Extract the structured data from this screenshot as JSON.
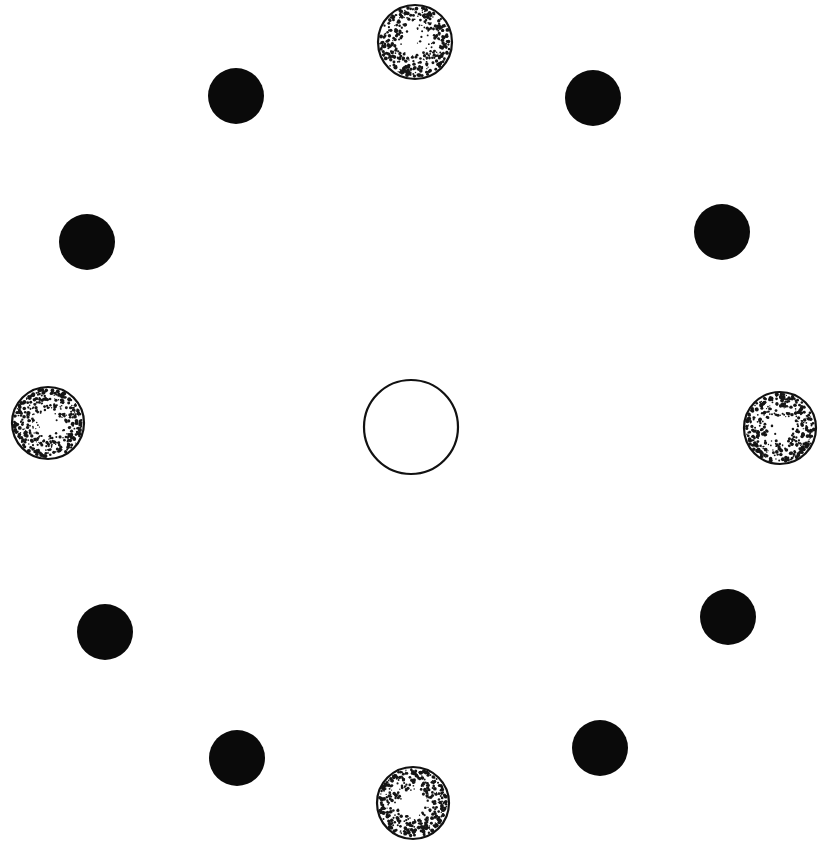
{
  "diagram": {
    "type": "circular-arrangement",
    "background": "#ffffff",
    "colors": {
      "solid": "#0a0a0a",
      "stroke": "#111111",
      "stipple": "#151515"
    },
    "center": {
      "kind": "open-circle",
      "x": 411,
      "y": 427,
      "r": 47
    },
    "stippled": [
      {
        "id": "top",
        "x": 415,
        "y": 42,
        "r": 37
      },
      {
        "id": "right",
        "x": 780,
        "y": 428,
        "r": 36
      },
      {
        "id": "bottom",
        "x": 413,
        "y": 803,
        "r": 36
      },
      {
        "id": "left",
        "x": 48,
        "y": 423,
        "r": 36
      }
    ],
    "solid": [
      {
        "id": "upper-left",
        "x": 236,
        "y": 96,
        "r": 28
      },
      {
        "id": "upper-right",
        "x": 593,
        "y": 98,
        "r": 28
      },
      {
        "id": "left-upper",
        "x": 87,
        "y": 242,
        "r": 28
      },
      {
        "id": "right-upper",
        "x": 722,
        "y": 232,
        "r": 28
      },
      {
        "id": "left-lower",
        "x": 105,
        "y": 632,
        "r": 28
      },
      {
        "id": "right-lower",
        "x": 728,
        "y": 617,
        "r": 28
      },
      {
        "id": "lower-left",
        "x": 237,
        "y": 758,
        "r": 28
      },
      {
        "id": "lower-right",
        "x": 600,
        "y": 748,
        "r": 28
      }
    ]
  }
}
